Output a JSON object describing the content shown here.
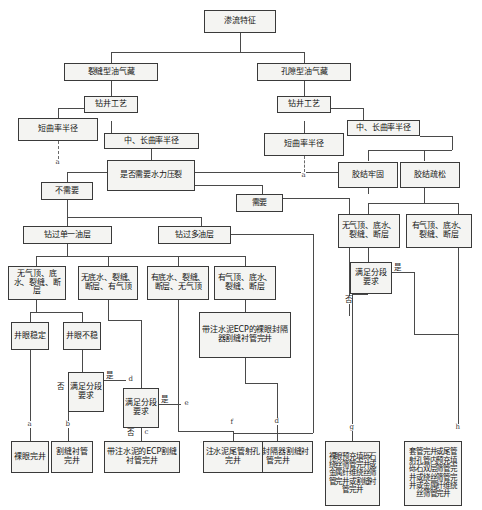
{
  "diagram": {
    "nodes": {
      "root": "渗流特征",
      "fracture_reservoir": "裂缝型油气藏",
      "pore_reservoir": "孔隙型油气藏",
      "drilling_tech_left": "钻井工艺",
      "drilling_tech_right": "钻井工艺",
      "short_radius_left": "短曲率半径",
      "medium_long_radius_left": "中、长曲率半径",
      "short_radius_right": "短曲率半径",
      "medium_long_radius_right": "中、长曲率半径",
      "need_frac": "是否需要水力压裂",
      "not_need": "不需要",
      "need": "需要",
      "cement_firm": "胶结牢固",
      "cement_loose": "胶结疏松",
      "single_layer": "钻过单一油层",
      "multi_layer": "钻过多油层",
      "cond_1": "无气顶、底水、裂缝、断层",
      "cond_2": "无底水、裂缝、断层、有气顶",
      "cond_3": "有底水、裂缝、断层、无气顶",
      "cond_4": "有气顶、底水、裂缝、断层",
      "cond_r1": "无气顶、底水、裂缝、断层",
      "cond_r2": "有气顶、底水、裂缝、断层",
      "hole_stable": "井眼稳定",
      "hole_unstable": "井眼不稳",
      "ecp_liner": "带注水泥ECP的裸眼封隔器割缝衬管完井",
      "stage_req_1": "满足分段要求",
      "stage_req_2": "满足分段要求",
      "stage_req_3": "满足分段要求",
      "result_a": "裸眼完井",
      "result_b": "割缝衬管完井",
      "result_c": "带注水泥的ECP割缝衬管完井",
      "result_d": "裸眼封隔器割缝衬管完井",
      "result_f": "注水泥尾管射孔完井",
      "result_g": "裸眼预充填砾石绕丝筛管完井或金属纤维绕丝筛管完井或割缝衬管完井",
      "result_h": "套管完井或尾管射孔管内预充填砾石双层筛管完井或绕丝筛管完井或金属纤维绕丝筛管完井"
    },
    "edge_labels": {
      "yes_1": "是",
      "no_1": "否",
      "yes_2": "是",
      "no_2": "否",
      "yes_3": "是",
      "no_3": "否"
    },
    "tags": {
      "a_left": "a",
      "a_right": "a",
      "a": "a",
      "b": "b",
      "c": "c",
      "d_dec": "d",
      "e_dec": "e",
      "d": "d",
      "f": "f",
      "g": "g",
      "h": "h"
    }
  }
}
